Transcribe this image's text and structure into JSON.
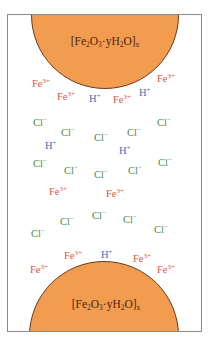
{
  "diagram": {
    "title": "",
    "colors": {
      "rust_fill": "#f29c50",
      "rust_outline": "#6b3a1a",
      "label_text": "#4a2410",
      "fe_ion": "#d85a3e",
      "h_ion": "#3c6fc4",
      "cl_ion": "#4a8c45",
      "frame_border": "#8a8a8a"
    },
    "rust_particles": [
      {
        "id": "top",
        "formula": "[Fe2O3·yH2O]x",
        "parts": {
          "open": "[Fe",
          "s1": "2",
          "o": "O",
          "s2": "3",
          "mid": "·yH",
          "s3": "2",
          "close": "O]",
          "s4": "x"
        }
      },
      {
        "id": "bottom",
        "formula": "[Fe2O3·yH2O]x",
        "parts": {
          "open": "[Fe",
          "s1": "2",
          "o": "O",
          "s2": "3",
          "mid": "·yH",
          "s3": "2",
          "close": "O]",
          "s4": "x"
        }
      }
    ],
    "ion_species": {
      "fe": {
        "symbol": "Fe",
        "charge": "3+"
      },
      "h": {
        "symbol": "H",
        "charge": "+"
      },
      "cl": {
        "symbol": "Cl",
        "charge": "−"
      }
    },
    "ions": [
      {
        "type": "fe",
        "x": 32,
        "y": 78
      },
      {
        "type": "fe",
        "x": 57,
        "y": 91
      },
      {
        "type": "h",
        "x": 89,
        "y": 93
      },
      {
        "type": "fe",
        "x": 113,
        "y": 94
      },
      {
        "type": "h",
        "x": 139,
        "y": 87
      },
      {
        "type": "fe",
        "x": 157,
        "y": 73
      },
      {
        "type": "cl",
        "x": 33,
        "y": 117
      },
      {
        "type": "cl",
        "x": 61,
        "y": 127
      },
      {
        "type": "cl",
        "x": 94,
        "y": 132
      },
      {
        "type": "cl",
        "x": 127,
        "y": 127
      },
      {
        "type": "cl",
        "x": 157,
        "y": 117
      },
      {
        "type": "h",
        "x": 45,
        "y": 140
      },
      {
        "type": "h",
        "x": 119,
        "y": 145
      },
      {
        "type": "cl",
        "x": 33,
        "y": 158
      },
      {
        "type": "cl",
        "x": 64,
        "y": 165
      },
      {
        "type": "cl",
        "x": 94,
        "y": 169
      },
      {
        "type": "cl",
        "x": 128,
        "y": 165
      },
      {
        "type": "cl",
        "x": 158,
        "y": 157
      },
      {
        "type": "fe",
        "x": 49,
        "y": 186
      },
      {
        "type": "fe",
        "x": 106,
        "y": 188
      },
      {
        "type": "cl",
        "x": 60,
        "y": 216
      },
      {
        "type": "cl",
        "x": 92,
        "y": 210
      },
      {
        "type": "cl",
        "x": 123,
        "y": 214
      },
      {
        "type": "cl",
        "x": 31,
        "y": 228
      },
      {
        "type": "cl",
        "x": 154,
        "y": 224
      },
      {
        "type": "fe",
        "x": 64,
        "y": 250
      },
      {
        "type": "h",
        "x": 101,
        "y": 249
      },
      {
        "type": "fe",
        "x": 133,
        "y": 253
      },
      {
        "type": "fe",
        "x": 30,
        "y": 264
      },
      {
        "type": "fe",
        "x": 157,
        "y": 264
      }
    ]
  }
}
